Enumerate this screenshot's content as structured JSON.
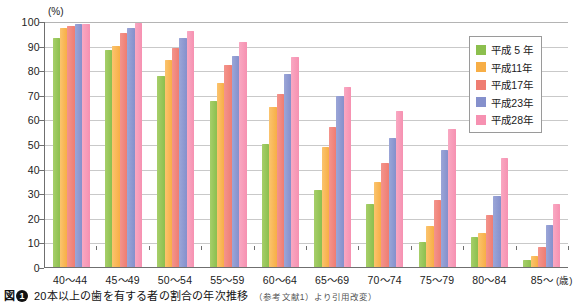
{
  "chart_data": {
    "type": "bar",
    "title": "20本以上の歯を有する者の割合の年次推移",
    "xlabel": "(歳)",
    "ylabel": "(%)",
    "ylim": [
      0,
      100
    ],
    "ystep": 10,
    "grid": true,
    "legend_position": "top-right",
    "categories": [
      "40〜44",
      "45〜49",
      "50〜54",
      "55〜59",
      "60〜64",
      "65〜69",
      "70〜74",
      "75〜79",
      "80〜84",
      "85〜"
    ],
    "yticks": [
      "100",
      "90",
      "80",
      "70",
      "60",
      "50",
      "40",
      "30",
      "20",
      "10",
      "0"
    ],
    "series": [
      {
        "name": "平成 5 年",
        "color": "#8cbf4e",
        "values": [
          92.9,
          88.1,
          77.5,
          67.3,
          49.9,
          31.4,
          25.5,
          10.0,
          12.0,
          2.8
        ]
      },
      {
        "name": "平成11年",
        "color": "#f7ae46",
        "values": [
          97.1,
          90.0,
          84.3,
          74.6,
          64.9,
          48.8,
          34.5,
          16.7,
          13.9,
          4.5
        ]
      },
      {
        "name": "平成17年",
        "color": "#ef7d72",
        "values": [
          97.8,
          95.0,
          88.9,
          82.3,
          70.3,
          57.1,
          42.4,
          27.1,
          21.1,
          8.3
        ]
      },
      {
        "name": "平成23年",
        "color": "#8590cc",
        "values": [
          98.7,
          97.1,
          92.9,
          85.7,
          78.4,
          69.6,
          52.3,
          47.6,
          28.9,
          17.0
        ]
      },
      {
        "name": "平成28年",
        "color": "#f691b1",
        "values": [
          98.8,
          99.0,
          95.9,
          91.3,
          85.2,
          73.0,
          63.4,
          56.1,
          44.2,
          25.7
        ]
      }
    ]
  },
  "axis": {
    "unit_y": "(%)",
    "unit_x": "(歳)"
  },
  "legend": {
    "items": [
      {
        "label": "平成 5 年"
      },
      {
        "label": "平成11年"
      },
      {
        "label": "平成17年"
      },
      {
        "label": "平成23年"
      },
      {
        "label": "平成28年"
      }
    ]
  },
  "caption": {
    "figure_label": "図",
    "figure_number": "❶",
    "text": "20本以上の歯を有する者の割合の年次推移",
    "source": "（参考文献1）より引用改変）"
  }
}
